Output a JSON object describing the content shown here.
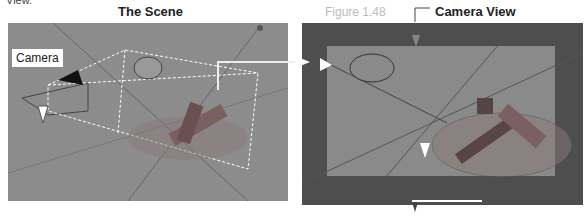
{
  "partial_header": "View.",
  "figure_label": "Figure 1.48",
  "left_panel": {
    "title": "The Scene",
    "callout": "Camera"
  },
  "right_panel": {
    "title": "Camera View"
  },
  "colors": {
    "scene_bg": "#8c8c8c",
    "camera_outer": "#4e4e4e",
    "camera_frame": "#8a8a8a",
    "object": "#7a6e6e"
  }
}
